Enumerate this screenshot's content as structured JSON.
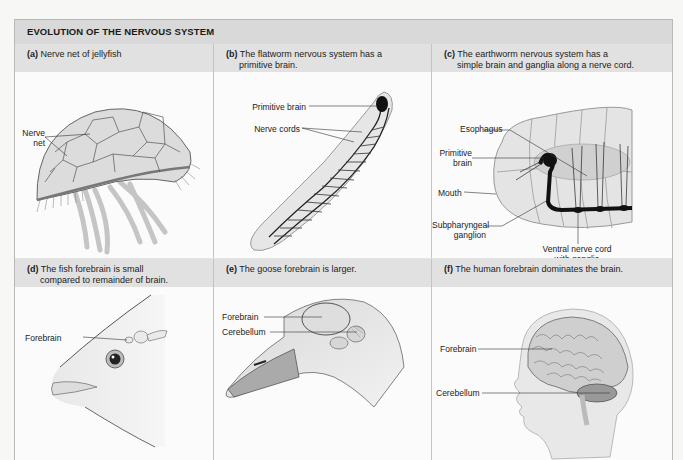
{
  "figure": {
    "title": "EVOLUTION OF THE NERVOUS SYSTEM",
    "panels": [
      {
        "id": "a",
        "letter": "(a)",
        "caption_line1": "Nerve net of jellyfish",
        "caption_line2": "",
        "subject": "jellyfish",
        "labels": [
          {
            "text_line1": "Nerve",
            "text_line2": "net"
          }
        ]
      },
      {
        "id": "b",
        "letter": "(b)",
        "caption_line1": "The flatworm nervous system has a",
        "caption_line2": "primitive brain.",
        "subject": "flatworm",
        "labels": [
          {
            "text": "Primitive brain"
          },
          {
            "text": "Nerve cords"
          }
        ]
      },
      {
        "id": "c",
        "letter": "(c)",
        "caption_line1": "The earthworm nervous system has a",
        "caption_line2": "simple brain and ganglia along a nerve cord.",
        "subject": "earthworm",
        "labels": [
          {
            "text": "Esophagus"
          },
          {
            "text_line1": "Primitive",
            "text_line2": "brain"
          },
          {
            "text": "Mouth"
          },
          {
            "text_line1": "Subpharyngeal",
            "text_line2": "ganglion"
          },
          {
            "text_line1": "Ventral nerve cord",
            "text_line2": "with ganglia"
          }
        ]
      },
      {
        "id": "d",
        "letter": "(d)",
        "caption_line1": "The fish forebrain is small",
        "caption_line2": "compared to remainder of brain.",
        "subject": "fish head",
        "labels": [
          {
            "text": "Forebrain"
          }
        ]
      },
      {
        "id": "e",
        "letter": "(e)",
        "caption_line1": "The goose forebrain is larger.",
        "caption_line2": "",
        "subject": "goose head",
        "labels": [
          {
            "text": "Forebrain"
          },
          {
            "text": "Cerebellum"
          }
        ]
      },
      {
        "id": "f",
        "letter": "(f)",
        "caption_line1": "The human forebrain dominates the brain.",
        "caption_line2": "",
        "subject": "human head",
        "labels": [
          {
            "text": "Forebrain"
          },
          {
            "text": "Cerebellum"
          }
        ]
      }
    ]
  },
  "colors": {
    "title_bar": "#d9d9d9",
    "caption_bar": "#e1e1e1",
    "panel_bg": "#fbfbfb",
    "border": "#b9b9b9",
    "nerve": "#1a1a1a"
  }
}
